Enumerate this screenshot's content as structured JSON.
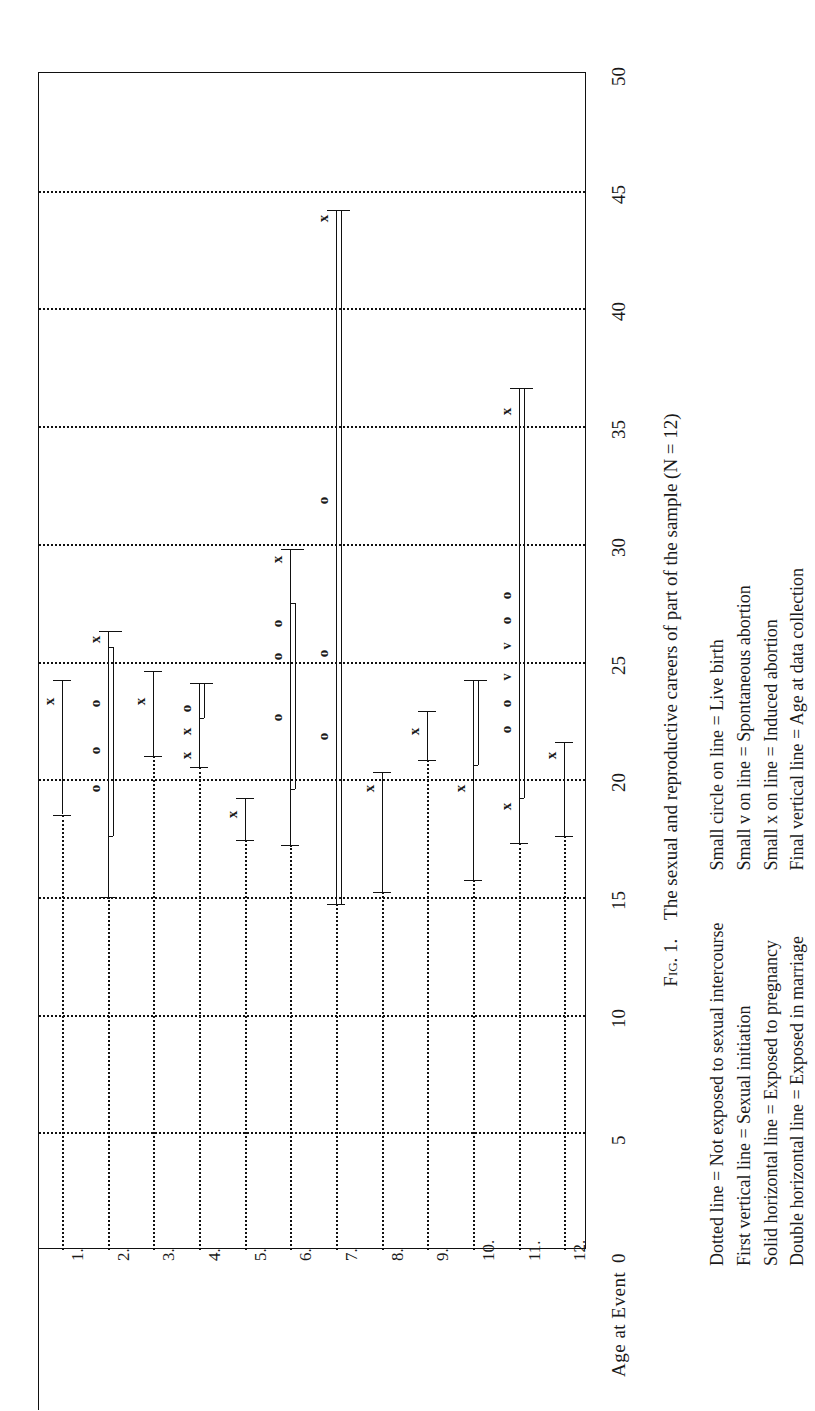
{
  "figure": {
    "caption_prefix": "Fig. 1.",
    "caption_text": "The sexual and reproductive careers of part of the sample (N = 12)",
    "axis_title": "Age at Event",
    "legend_left": [
      "Dotted line = Not exposed to sexual intercourse",
      "First vertical line = Sexual initiation",
      "Solid horizontal line = Exposed to pregnancy",
      "Double horizontal line = Exposed in marriage"
    ],
    "legend_right": [
      "Small circle on line = Live birth",
      "Small v on line = Spontaneous abortion",
      "Small x on line = Induced abortion",
      "Final vertical line = Age at data collection"
    ]
  },
  "chart_data": {
    "type": "line",
    "title": "The sexual and reproductive careers of part of the sample (N = 12)",
    "xlabel": "",
    "ylabel": "Age at Event",
    "ylim": [
      0,
      50
    ],
    "yticks": [
      0,
      5,
      10,
      15,
      20,
      25,
      30,
      35,
      40,
      45,
      50
    ],
    "grid": "dotted horizontal gridlines at every 5 years; dotted vertical line per case",
    "legend_position": "below figure, two columns",
    "categories": [
      "1.",
      "2.",
      "3.",
      "4.",
      "5.",
      "6.",
      "7.",
      "8.",
      "9.",
      "10.",
      "11.",
      "12."
    ],
    "series": [
      {
        "case": "1.",
        "dotted_to": 18.5,
        "solid": [
          18.5,
          24.2
        ],
        "double": null,
        "end_age": 24.2,
        "markers": [
          {
            "type": "x",
            "age": 23.3
          }
        ]
      },
      {
        "case": "2.",
        "dotted_to": 15.0,
        "solid": [
          15.0,
          26.3
        ],
        "double": [
          17.6,
          25.6
        ],
        "end_age": 26.3,
        "markers": [
          {
            "type": "o",
            "age": 19.6
          },
          {
            "type": "o",
            "age": 21.2
          },
          {
            "type": "o",
            "age": 23.2
          },
          {
            "type": "x",
            "age": 25.9
          }
        ]
      },
      {
        "case": "3.",
        "dotted_to": 21.0,
        "solid": [
          21.0,
          24.6
        ],
        "double": null,
        "end_age": 24.6,
        "markers": [
          {
            "type": "x",
            "age": 23.3
          }
        ]
      },
      {
        "case": "4.",
        "dotted_to": 20.5,
        "solid": [
          20.5,
          24.1
        ],
        "double": [
          22.6,
          24.1
        ],
        "end_age": 24.1,
        "markers": [
          {
            "type": "x",
            "age": 21.0
          },
          {
            "type": "x",
            "age": 22.0
          },
          {
            "type": "o",
            "age": 23.0
          }
        ]
      },
      {
        "case": "5.",
        "dotted_to": 17.4,
        "solid": [
          17.4,
          19.2
        ],
        "double": null,
        "end_age": 19.2,
        "markers": [
          {
            "type": "x",
            "age": 18.5
          }
        ]
      },
      {
        "case": "6.",
        "dotted_to": 17.2,
        "solid": [
          17.2,
          29.8
        ],
        "double": [
          19.6,
          27.5
        ],
        "end_age": 29.8,
        "markers": [
          {
            "type": "o",
            "age": 22.6
          },
          {
            "type": "o",
            "age": 25.2
          },
          {
            "type": "o",
            "age": 26.6
          },
          {
            "type": "x",
            "age": 29.3
          }
        ]
      },
      {
        "case": "7.",
        "dotted_to": 14.7,
        "solid": [
          14.7,
          44.2
        ],
        "double": [
          14.7,
          44.2
        ],
        "end_age": 44.2,
        "markers": [
          {
            "type": "o",
            "age": 21.8
          },
          {
            "type": "o",
            "age": 25.3
          },
          {
            "type": "o",
            "age": 31.8
          },
          {
            "type": "x",
            "age": 43.8
          }
        ]
      },
      {
        "case": "8.",
        "dotted_to": 15.2,
        "solid": [
          15.2,
          20.3
        ],
        "double": null,
        "end_age": 20.3,
        "markers": [
          {
            "type": "x",
            "age": 19.6
          }
        ]
      },
      {
        "case": "9.",
        "dotted_to": 20.8,
        "solid": [
          20.8,
          22.9
        ],
        "double": null,
        "end_age": 22.9,
        "markers": [
          {
            "type": "x",
            "age": 22.0
          }
        ]
      },
      {
        "case": "10.",
        "dotted_to": 15.7,
        "solid": [
          15.7,
          24.2
        ],
        "double": [
          20.6,
          24.2
        ],
        "end_age": 24.2,
        "markers": [
          {
            "type": "x",
            "age": 19.6
          }
        ]
      },
      {
        "case": "11.",
        "dotted_to": 17.3,
        "solid": [
          17.3,
          36.6
        ],
        "double": [
          19.2,
          36.6
        ],
        "end_age": 36.6,
        "markers": [
          {
            "type": "x",
            "age": 18.8
          },
          {
            "type": "o",
            "age": 22.1
          },
          {
            "type": "o",
            "age": 23.2
          },
          {
            "type": "v",
            "age": 24.3
          },
          {
            "type": "v",
            "age": 25.6
          },
          {
            "type": "o",
            "age": 26.7
          },
          {
            "type": "o",
            "age": 27.8
          },
          {
            "type": "x",
            "age": 35.6
          }
        ]
      },
      {
        "case": "12.",
        "dotted_to": 17.6,
        "solid": [
          17.6,
          21.6
        ],
        "double": null,
        "end_age": 21.6,
        "markers": [
          {
            "type": "x",
            "age": 21.0
          }
        ]
      }
    ]
  }
}
